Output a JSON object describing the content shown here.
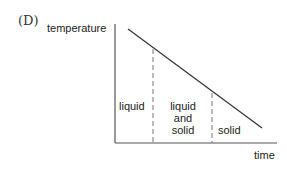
{
  "figure": {
    "option_label": "(D)",
    "y_axis_label": "temperature",
    "x_axis_label": "time",
    "regions": [
      {
        "label": "liquid"
      },
      {
        "label": "liquid\nand\nsolid",
        "lines": [
          "liquid",
          "and",
          "solid"
        ]
      },
      {
        "label": "solid"
      }
    ]
  },
  "colors": {
    "axis": "#555555",
    "line": "#333333",
    "dash": "#777777",
    "text": "#222222"
  }
}
